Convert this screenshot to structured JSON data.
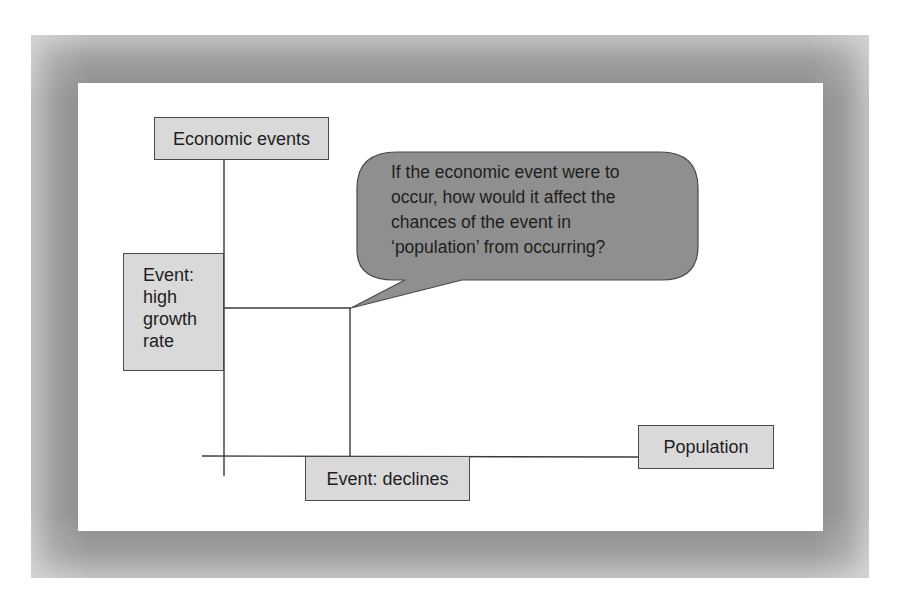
{
  "diagram": {
    "y_axis_label": "Economic events",
    "x_axis_label": "Population",
    "y_event": {
      "lines": [
        "Event:",
        "high",
        "growth",
        "rate"
      ]
    },
    "x_event": "Event: declines",
    "callout": {
      "lines": [
        "If the economic event were to",
        "occur, how would it affect the",
        "chances of the event in",
        "‘population’ from occurring?"
      ]
    },
    "colors": {
      "box_fill": "#d9d9d9",
      "callout_fill": "#8f8f8f",
      "frame": "#8c8c8c",
      "line": "#3a3a3a"
    }
  }
}
